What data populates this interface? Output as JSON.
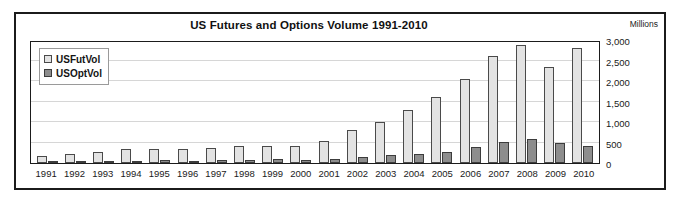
{
  "chart": {
    "title": "US Futures and Options Volume 1991-2010",
    "units_label": "Millions"
  },
  "legend": {
    "items": [
      {
        "label": "USFutVol",
        "color": "#e3e3e3"
      },
      {
        "label": "USOptVol",
        "color": "#8d8d8d"
      }
    ]
  },
  "chart_data": {
    "type": "bar",
    "title": "US Futures and Options Volume 1991-2010",
    "subtitle": "",
    "xlabel": "",
    "ylabel": "Millions",
    "ylim": [
      0,
      3000
    ],
    "ytick_labels": [
      "3,000",
      "2,500",
      "2,000",
      "1,500",
      "1,000",
      "500",
      "0"
    ],
    "yticks": [
      3000,
      2500,
      2000,
      1500,
      1000,
      500,
      0
    ],
    "grid": true,
    "legend_position": "top-left",
    "categories": [
      "1991",
      "1992",
      "1993",
      "1994",
      "1995",
      "1996",
      "1997",
      "1998",
      "1999",
      "2000",
      "2001",
      "2002",
      "2003",
      "2004",
      "2005",
      "2006",
      "2007",
      "2008",
      "2009",
      "2010"
    ],
    "series": [
      {
        "name": "USFutVol",
        "color": "#e3e3e3",
        "values": [
          160,
          215,
          265,
          345,
          330,
          340,
          360,
          425,
          420,
          415,
          545,
          800,
          1010,
          1300,
          1600,
          2050,
          2620,
          2870,
          2330,
          2800
        ]
      },
      {
        "name": "USOptVol",
        "color": "#8d8d8d",
        "values": [
          30,
          35,
          45,
          50,
          65,
          45,
          75,
          75,
          90,
          75,
          95,
          145,
          195,
          215,
          280,
          400,
          505,
          580,
          500,
          425
        ]
      }
    ]
  }
}
